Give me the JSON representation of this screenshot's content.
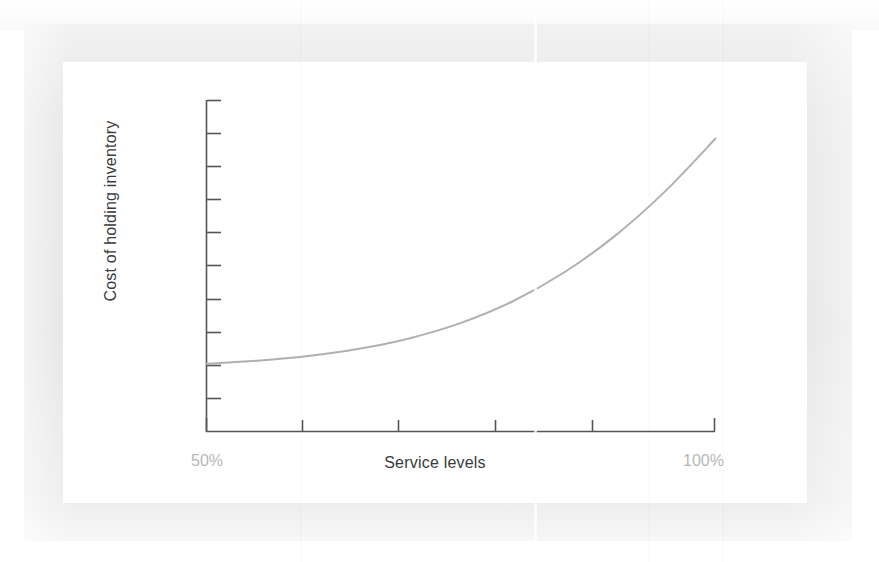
{
  "figure": {
    "kind": "line-chart-figure",
    "background_color": "#ffffff",
    "card_color": "#ffffff",
    "frame_color": "#e7e7e7"
  },
  "chart_data": {
    "type": "line",
    "title": "",
    "subtitle": "",
    "xlabel": "Service levels",
    "ylabel": "Cost of holding inventory",
    "x_tick_labels": [
      "50%",
      "100%"
    ],
    "y_tick_labels": [],
    "xlim": [
      50,
      100
    ],
    "ylim": [
      0,
      100
    ],
    "grid": false,
    "legend": null,
    "legend_position": "none",
    "annotations": [],
    "series": [
      {
        "name": "Cost of holding inventory",
        "color": "#b0b0b0",
        "line_width": 2,
        "x": [
          50,
          55,
          60,
          65,
          70,
          75,
          80,
          85,
          90,
          95,
          100
        ],
        "values": [
          20.5,
          21.4,
          22.8,
          25.0,
          28.2,
          32.8,
          39.2,
          47.8,
          58.8,
          72.4,
          88.5
        ]
      }
    ],
    "x_axis": {
      "tick_count": 6,
      "tick_direction": "up",
      "axis_color": "#555555"
    },
    "y_axis": {
      "tick_count": 10,
      "tick_direction": "right",
      "axis_color": "#555555"
    },
    "colors": {
      "curve": "#b0b0b0",
      "axis": "#555555",
      "tick_label": "#b7b7b7",
      "axis_title": "#3a3a3a"
    }
  }
}
